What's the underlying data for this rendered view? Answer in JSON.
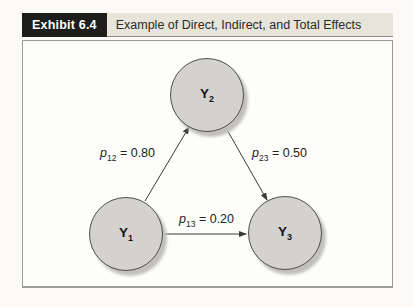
{
  "exhibit": {
    "label": "Exhibit 6.4",
    "title": "Example of Direct, Indirect, and Total Effects"
  },
  "diagram": {
    "type": "path-diagram",
    "nodes": {
      "y2": {
        "symbol": "Y",
        "subscript": "2",
        "position": "top-center"
      },
      "y1": {
        "symbol": "Y",
        "subscript": "1",
        "position": "bottom-left"
      },
      "y3": {
        "symbol": "Y",
        "subscript": "3",
        "position": "bottom-right"
      }
    },
    "paths": {
      "p12": {
        "symbol": "p",
        "subscript": "12",
        "equation": "= 0.80",
        "from": "Y1",
        "to": "Y2"
      },
      "p23": {
        "symbol": "p",
        "subscript": "23",
        "equation": "= 0.50",
        "from": "Y2",
        "to": "Y3"
      },
      "p13": {
        "symbol": "p",
        "subscript": "13",
        "equation": "= 0.20",
        "from": "Y1",
        "to": "Y3"
      }
    }
  },
  "colors": {
    "exhibit_label_bg": "#1d1d1b",
    "exhibit_label_text": "#ffffff",
    "exhibit_title_bg": "#e7e4da",
    "node_fill": "#d3d2cf",
    "node_border": "#4e4e4b",
    "node_shadow": "#c2c0bc",
    "arrow": "#3a3a38",
    "frame_border": "#9b9b97"
  }
}
